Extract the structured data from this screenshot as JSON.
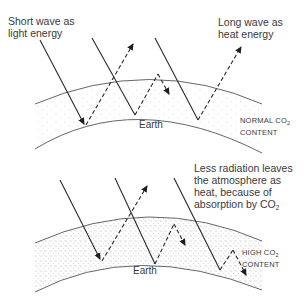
{
  "top_diagram": {
    "short_wave_label_line1": "Short wave as",
    "short_wave_label_line2": "light energy",
    "long_wave_label_line1": "Long wave as",
    "long_wave_label_line2": "heat energy",
    "earth_label": "Earth",
    "content_label_line1": "NORMAL CO",
    "content_label_sub": "2",
    "content_label_line2": "CONTENT"
  },
  "bottom_diagram": {
    "caption_line1": "Less radiation leaves",
    "caption_line2": "the atmosphere as",
    "caption_line3": "heat, because of",
    "caption_line4": "absorption by CO",
    "caption_sub": "2",
    "earth_label": "Earth",
    "content_label_line1": "HIGH CO",
    "content_label_sub": "2",
    "content_label_line2": "CONTENT"
  },
  "colors": {
    "line": "#2a2a2a",
    "arc": "#555555",
    "text": "#3a3a3a",
    "dots": "#9a9a9a"
  }
}
